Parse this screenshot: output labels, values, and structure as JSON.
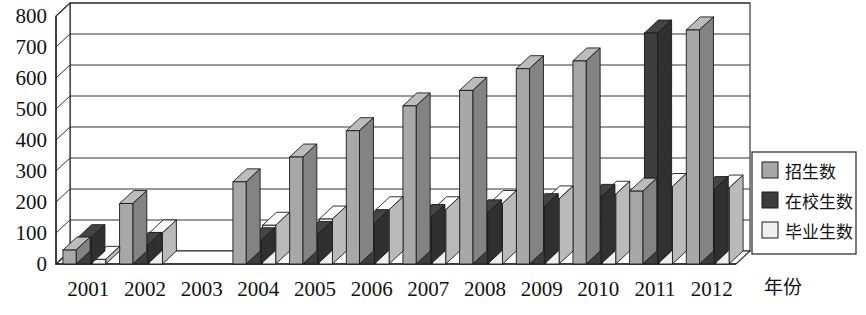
{
  "chart_data": {
    "type": "bar",
    "title": "",
    "xlabel": "年份",
    "ylabel": "",
    "ylim": [
      0,
      800
    ],
    "yticks": [
      0,
      100,
      200,
      300,
      400,
      500,
      600,
      700,
      800
    ],
    "grid": true,
    "legend_position": "right",
    "style": "3d-bar",
    "categories": [
      "2001",
      "2002",
      "2003",
      "2004",
      "2005",
      "2006",
      "2007",
      "2008",
      "2009",
      "2010",
      "2011",
      "2012"
    ],
    "series": [
      {
        "name": "招生数",
        "color": "#a8a8a8",
        "values": [
          45,
          195,
          0,
          265,
          345,
          430,
          510,
          560,
          630,
          655,
          235,
          755
        ]
      },
      {
        "name": "在校生数",
        "color": "#3d3d3d",
        "values": [
          85,
          60,
          0,
          75,
          95,
          130,
          150,
          165,
          185,
          215,
          745,
          240
        ]
      },
      {
        "name": "毕业生数",
        "color": "#efefef",
        "values": [
          15,
          100,
          0,
          125,
          145,
          175,
          175,
          195,
          210,
          225,
          250,
          245
        ]
      }
    ]
  },
  "legend": {
    "items": [
      {
        "label": "招生数",
        "swatch": "#a8a8a8"
      },
      {
        "label": "在校生数",
        "swatch": "#3d3d3d"
      },
      {
        "label": "毕业生数",
        "swatch": "#efefef"
      }
    ]
  },
  "axis": {
    "x_title": "年份",
    "y_labels": [
      "800",
      "700",
      "600",
      "500",
      "400",
      "300",
      "200",
      "100",
      "0"
    ],
    "x_labels": [
      "2001",
      "2002",
      "2003",
      "2004",
      "2005",
      "2006",
      "2007",
      "2008",
      "2009",
      "2010",
      "2011",
      "2012"
    ]
  }
}
